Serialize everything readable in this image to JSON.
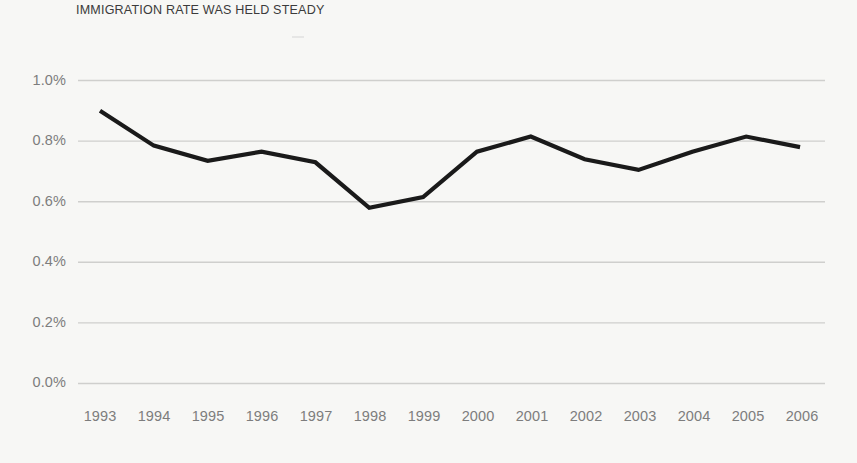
{
  "figure": {
    "title": "IMMIGRATION RATE WAS HELD STEADY",
    "background_color": "#f7f7f5",
    "line_color": "#1a1a1a",
    "grid_color": "#cfcfcd",
    "tick_label_color": "#7d7d7d",
    "title_color": "#3b3b3b"
  },
  "chart_data": {
    "type": "line",
    "title": "IMMIGRATION RATE WAS HELD STEADY",
    "xlabel": "",
    "ylabel": "",
    "categories": [
      "1993",
      "1994",
      "1995",
      "1996",
      "1997",
      "1998",
      "1999",
      "2000",
      "2001",
      "2002",
      "2003",
      "2004",
      "2005",
      "2006"
    ],
    "x": [
      1993,
      1994,
      1995,
      1996,
      1997,
      1998,
      1999,
      2000,
      2001,
      2002,
      2003,
      2004,
      2005,
      2006
    ],
    "values": [
      0.9,
      0.785,
      0.735,
      0.765,
      0.73,
      0.58,
      0.615,
      0.765,
      0.815,
      0.74,
      0.705,
      0.765,
      0.815,
      0.78
    ],
    "series": [
      {
        "name": "Immigration rate",
        "values": [
          0.9,
          0.785,
          0.735,
          0.765,
          0.73,
          0.58,
          0.615,
          0.765,
          0.815,
          0.74,
          0.705,
          0.765,
          0.815,
          0.78
        ]
      }
    ],
    "unit": "%",
    "ylim": [
      0.0,
      1.0
    ],
    "yticks": [
      0.0,
      0.2,
      0.4,
      0.6,
      0.8,
      1.0
    ],
    "ytick_labels": [
      "0.0%",
      "0.2%",
      "0.4%",
      "0.6%",
      "0.8%",
      "1.0%"
    ],
    "xtick_labels": [
      "1993",
      "1994",
      "1995",
      "1996",
      "1997",
      "1998",
      "1999",
      "2000",
      "2001",
      "2002",
      "2003",
      "2004",
      "2005",
      "2006"
    ],
    "grid": "horizontal",
    "legend": "none"
  }
}
